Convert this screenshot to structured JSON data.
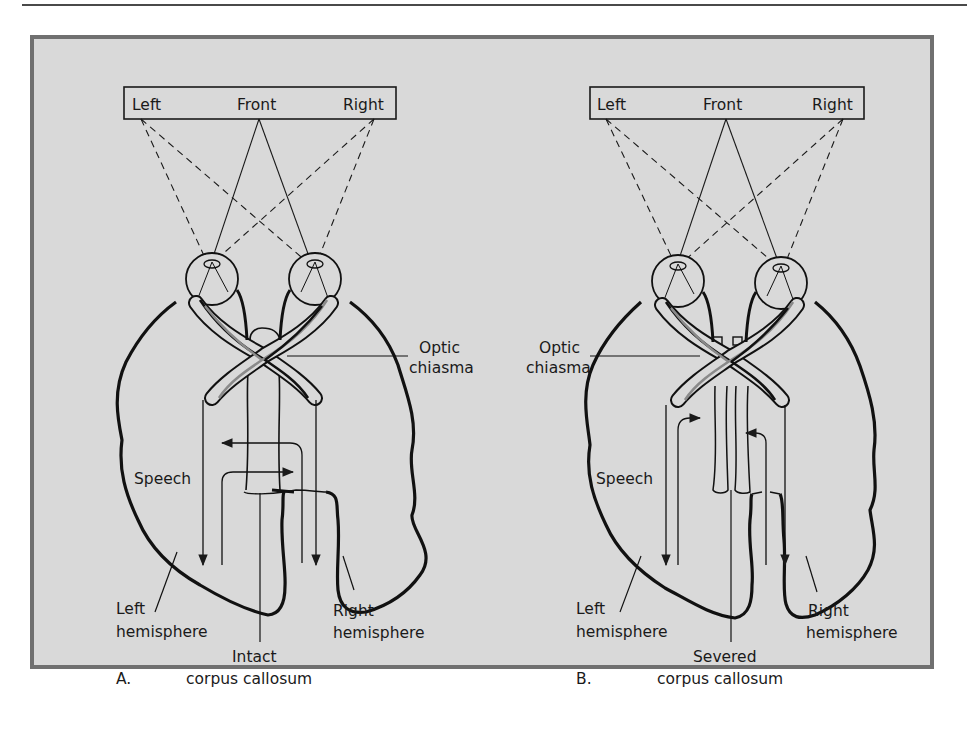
{
  "panels": [
    {
      "id": "A",
      "letter": "A.",
      "field_labels": {
        "left": "Left",
        "front": "Front",
        "right": "Right"
      },
      "optic_label_1": "Optic",
      "optic_label_2": "chiasma",
      "speech": "Speech",
      "left_hemi_1": "Left",
      "left_hemi_2": "hemisphere",
      "right_hemi_1": "Right",
      "right_hemi_2": "hemisphere",
      "cc_label_1": "Intact",
      "cc_label_2": "corpus callosum"
    },
    {
      "id": "B",
      "letter": "B.",
      "field_labels": {
        "left": "Left",
        "front": "Front",
        "right": "Right"
      },
      "optic_label_1": "Optic",
      "optic_label_2": "chiasma",
      "speech": "Speech",
      "left_hemi_1": "Left",
      "left_hemi_2": "hemisphere",
      "right_hemi_1": "Right",
      "right_hemi_2": "hemisphere",
      "cc_label_1": "Severed",
      "cc_label_2": "corpus callosum"
    }
  ],
  "colors": {
    "background": "#d9d9d9",
    "frame_border": "#707070",
    "ink": "#1a1a1a",
    "gray_tract": "#8a8a8a"
  }
}
